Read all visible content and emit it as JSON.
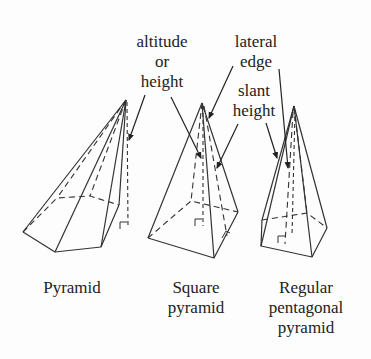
{
  "annotations": {
    "altitude": "altitude",
    "altitude_or": "or",
    "altitude_height": "height",
    "lateral": "lateral",
    "lateral_edge": "edge",
    "slant": "slant",
    "slant_height": "height"
  },
  "captions": {
    "pyramid": "Pyramid",
    "square_1": "Square",
    "square_2": "pyramid",
    "pentagonal_1": "Regular",
    "pentagonal_2": "pentagonal",
    "pentagonal_3": "pyramid"
  },
  "colors": {
    "line": "#333333",
    "text": "#222222",
    "background": "#fdfdfd"
  }
}
